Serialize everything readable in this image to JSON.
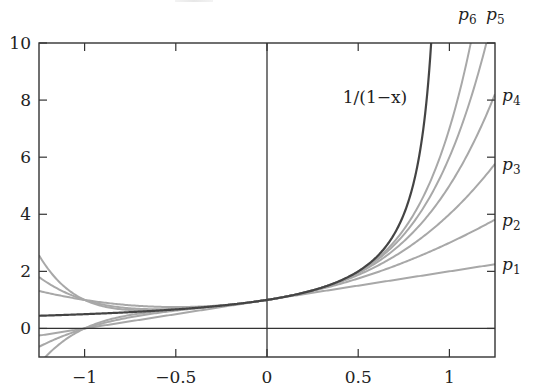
{
  "chart_data": {
    "type": "line",
    "title": "",
    "xlabel": "",
    "ylabel": "",
    "xlim": [
      -1.25,
      1.25
    ],
    "ylim": [
      -1,
      10
    ],
    "grid": false,
    "legend_position": "inline labels at right edge",
    "x_ticks": [
      -1,
      -0.5,
      0,
      0.5,
      1
    ],
    "x_tick_labels": [
      "−1",
      "−0.5",
      "0",
      "0.5",
      "1"
    ],
    "y_ticks": [
      0,
      2,
      4,
      6,
      8,
      10
    ],
    "y_tick_labels": [
      "0",
      "2",
      "4",
      "6",
      "8",
      "10"
    ],
    "reference_lines": {
      "x": 0,
      "y": 0
    },
    "series": [
      {
        "name": "1/(1−x)",
        "function": "1/(1-x)",
        "color": "#444444",
        "width": 2.2,
        "label": "1/(1−x)",
        "label_pos": [
          375,
          97
        ]
      },
      {
        "name": "p1",
        "function": "sum x^k, k=0..1",
        "coefficients": [
          1,
          1
        ],
        "color": "#a8a8a8",
        "label_base": "p",
        "label_sub": "1",
        "label_pos": [
          503,
          270
        ],
        "value_at_x_max": 2.25
      },
      {
        "name": "p2",
        "function": "sum x^k, k=0..2",
        "coefficients": [
          1,
          1,
          1
        ],
        "color": "#a8a8a8",
        "label_base": "p",
        "label_sub": "2",
        "label_pos": [
          503,
          226
        ],
        "value_at_x_max": 3.81
      },
      {
        "name": "p3",
        "function": "sum x^k, k=0..3",
        "coefficients": [
          1,
          1,
          1,
          1
        ],
        "color": "#a8a8a8",
        "label_base": "p",
        "label_sub": "3",
        "label_pos": [
          503,
          170
        ],
        "value_at_x_max": 5.77
      },
      {
        "name": "p4",
        "function": "sum x^k, k=0..4",
        "coefficients": [
          1,
          1,
          1,
          1,
          1
        ],
        "color": "#a8a8a8",
        "label_base": "p",
        "label_sub": "4",
        "label_pos": [
          503,
          101
        ],
        "value_at_x_max": 8.21
      },
      {
        "name": "p5",
        "function": "sum x^k, k=0..5",
        "coefficients": [
          1,
          1,
          1,
          1,
          1,
          1
        ],
        "color": "#a8a8a8",
        "label_base": "p",
        "label_sub": "5",
        "label_pos": [
          486,
          34
        ]
      },
      {
        "name": "p6",
        "function": "sum x^k, k=0..6",
        "coefficients": [
          1,
          1,
          1,
          1,
          1,
          1,
          1
        ],
        "color": "#a8a8a8",
        "label_base": "p",
        "label_sub": "6",
        "label_pos": [
          458,
          34
        ]
      }
    ]
  },
  "labels": {
    "curve_main": "1/(1−x)",
    "p1": "p",
    "p1_sub": "1",
    "p2": "p",
    "p2_sub": "2",
    "p3": "p",
    "p3_sub": "3",
    "p4": "p",
    "p4_sub": "4",
    "p5": "p",
    "p5_sub": "5",
    "p6": "p",
    "p6_sub": "6"
  },
  "style": {
    "axis_color": "#333333",
    "main_curve_color": "#444444",
    "taylor_curve_color": "#a8a8a8"
  }
}
